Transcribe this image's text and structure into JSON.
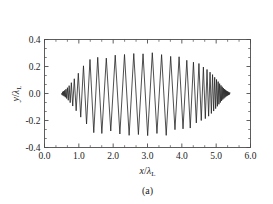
{
  "figure": {
    "caption": "(a)"
  },
  "chart_data": {
    "type": "line",
    "title": "",
    "subtitle": "",
    "xlabel": "x/λ_L",
    "ylabel": "y/λ_L",
    "xlabel_parts": {
      "var": "x",
      "slash": "/",
      "lambda": "λ",
      "sub": "L"
    },
    "ylabel_parts": {
      "var": "y",
      "slash": "/",
      "lambda": "λ",
      "sub": "L"
    },
    "xlim": [
      0.0,
      6.0
    ],
    "ylim": [
      -0.4,
      0.4
    ],
    "xticks": [
      0.0,
      1.0,
      2.0,
      3.0,
      4.0,
      5.0,
      6.0
    ],
    "xtick_labels": [
      "0.0",
      "1.0",
      "2.0",
      "3.0",
      "4.0",
      "5.0",
      "6.0"
    ],
    "yticks": [
      -0.4,
      -0.2,
      0.0,
      0.2,
      0.4
    ],
    "ytick_labels": [
      "-0.4",
      "-0.2",
      "0.0",
      "0.2",
      "0.4"
    ],
    "x_minor_per_interval": 2,
    "y_minor_per_interval": 2,
    "grid": false,
    "legend": null,
    "line_color": "#222222",
    "frame_color": "#4d4d4d",
    "background": "#ffffff",
    "series": [
      {
        "name": "trajectory",
        "x": [
          0.5,
          0.515,
          0.53,
          0.545,
          0.56,
          0.575,
          0.59,
          0.608,
          0.626,
          0.646,
          0.668,
          0.692,
          0.718,
          0.748,
          0.782,
          0.822,
          0.868,
          0.922,
          0.985,
          1.055,
          1.135,
          1.225,
          1.325,
          1.435,
          1.55,
          1.67,
          1.8,
          1.93,
          2.06,
          2.195,
          2.33,
          2.465,
          2.6,
          2.735,
          2.87,
          3.005,
          3.14,
          3.275,
          3.41,
          3.545,
          3.675,
          3.8,
          3.92,
          4.035,
          4.145,
          4.245,
          4.338,
          4.422,
          4.498,
          4.566,
          4.628,
          4.684,
          4.734,
          4.78,
          4.822,
          4.86,
          4.895,
          4.927,
          4.957,
          4.985,
          5.011,
          5.035,
          5.058,
          5.08,
          5.101,
          5.121,
          5.14,
          5.158,
          5.175,
          5.192,
          5.208,
          5.224,
          5.239,
          5.254,
          5.268,
          5.282,
          5.296,
          5.31,
          5.324,
          5.337,
          5.35,
          5.363,
          5.376,
          5.389,
          5.4
        ],
        "y": [
          0.0,
          -0.012,
          0.013,
          -0.016,
          0.018,
          -0.021,
          0.024,
          -0.028,
          0.032,
          -0.037,
          0.043,
          -0.05,
          0.058,
          -0.068,
          0.08,
          -0.093,
          0.109,
          -0.128,
          0.15,
          -0.175,
          0.205,
          -0.226,
          0.252,
          -0.29,
          0.268,
          -0.296,
          0.262,
          -0.278,
          0.284,
          -0.3,
          0.289,
          -0.31,
          0.296,
          -0.304,
          0.294,
          -0.312,
          0.302,
          -0.296,
          0.288,
          -0.31,
          0.275,
          -0.268,
          0.272,
          -0.262,
          0.246,
          -0.256,
          0.232,
          -0.218,
          0.222,
          -0.2,
          0.196,
          -0.186,
          0.178,
          -0.168,
          0.158,
          -0.148,
          0.14,
          -0.13,
          0.12,
          -0.112,
          0.104,
          -0.095,
          0.088,
          -0.08,
          0.073,
          -0.067,
          0.06,
          -0.055,
          0.05,
          -0.045,
          0.041,
          -0.037,
          0.033,
          -0.03,
          0.027,
          -0.024,
          0.021,
          -0.019,
          0.017,
          -0.015,
          0.013,
          -0.011,
          0.009,
          -0.007,
          0.005
        ]
      }
    ]
  }
}
